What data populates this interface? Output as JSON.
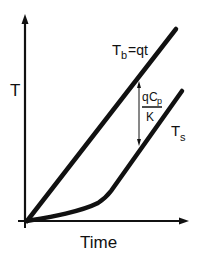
{
  "diagram": {
    "y_axis_label": "T",
    "x_axis_label": "Time",
    "lines": {
      "bulk": {
        "label_main": "T",
        "label_sub": "b",
        "label_rest": "=qt"
      },
      "surface": {
        "label_main": "T",
        "label_sub": "s"
      }
    },
    "gap_annotation": {
      "numerator_q": "q",
      "numerator_c": "C",
      "numerator_sub": "p",
      "denominator": "K"
    },
    "colors": {
      "stroke": "#111111",
      "background": "#ffffff"
    }
  }
}
